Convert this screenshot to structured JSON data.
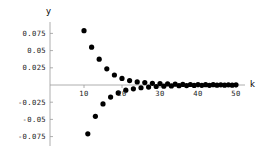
{
  "chart_data": {
    "type": "scatter",
    "title": "",
    "xlabel": "k",
    "ylabel": "y",
    "xlim": [
      7.5,
      52.5
    ],
    "ylim": [
      -0.088,
      0.088
    ],
    "grid": false,
    "legend": null,
    "marker": {
      "shape": "circle",
      "color": "#000000",
      "size": 2.6
    },
    "axis_color": "#808080",
    "xticks": [
      10,
      20,
      30,
      40,
      50
    ],
    "xtick_labels": [
      "10",
      "20",
      "30",
      "40",
      "50"
    ],
    "yticks": [
      0.075,
      0.05,
      0.025,
      -0.025,
      -0.05,
      -0.075
    ],
    "ytick_labels": [
      "0.075",
      "0.05",
      "0.025",
      "-0.025",
      "-0.05",
      "-0.075"
    ],
    "x": [
      10,
      11,
      12,
      13,
      14,
      15,
      16,
      17,
      18,
      19,
      20,
      21,
      22,
      23,
      24,
      25,
      26,
      27,
      28,
      29,
      30,
      31,
      32,
      33,
      34,
      35,
      36,
      37,
      38,
      39,
      40,
      41,
      42,
      43,
      44,
      45,
      46,
      47,
      48,
      49,
      50
    ],
    "y": [
      0.079,
      -0.071,
      0.055,
      -0.0455,
      0.0375,
      -0.0275,
      0.0235,
      -0.0175,
      0.0145,
      -0.0115,
      0.0095,
      -0.0075,
      0.0065,
      -0.0055,
      0.0045,
      -0.004,
      0.0035,
      -0.003,
      0.0025,
      -0.0022,
      0.002,
      -0.0017,
      0.0015,
      -0.0013,
      0.0012,
      -0.001,
      0.0009,
      -0.0008,
      0.0007,
      -0.0006,
      0.0006,
      -0.0005,
      0.0005,
      -0.0004,
      0.0004,
      -0.0003,
      0.0003,
      -0.0003,
      0.0002,
      -0.0002,
      0.0002
    ]
  },
  "axes": {
    "y_axis_name": "y",
    "x_axis_name": "k"
  }
}
